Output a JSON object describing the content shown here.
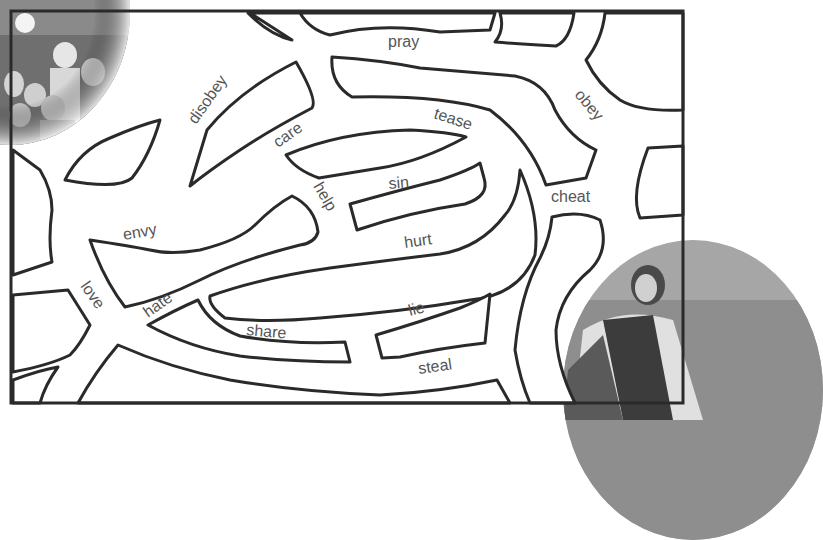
{
  "worksheet": {
    "type": "word maze",
    "start_image": "children by the sea",
    "end_image": "Jesus"
  },
  "words": [
    {
      "text": "pray",
      "x": 405,
      "y": 47,
      "rotate": 0
    },
    {
      "text": "disobey",
      "x": 208,
      "y": 100,
      "rotate": -55
    },
    {
      "text": "obey",
      "x": 584,
      "y": 110,
      "rotate": 52
    },
    {
      "text": "care",
      "x": 293,
      "y": 135,
      "rotate": -35
    },
    {
      "text": "tease",
      "x": 457,
      "y": 128,
      "rotate": 18
    },
    {
      "text": "sin",
      "x": 403,
      "y": 186,
      "rotate": -5
    },
    {
      "text": "help",
      "x": 322,
      "y": 200,
      "rotate": 60
    },
    {
      "text": "cheat",
      "x": 575,
      "y": 200,
      "rotate": 0
    },
    {
      "text": "envy",
      "x": 145,
      "y": 234,
      "rotate": -10
    },
    {
      "text": "hurt",
      "x": 424,
      "y": 243,
      "rotate": -8
    },
    {
      "text": "love",
      "x": 92,
      "y": 298,
      "rotate": 55
    },
    {
      "text": "hate",
      "x": 163,
      "y": 306,
      "rotate": -35
    },
    {
      "text": "lie",
      "x": 420,
      "y": 310,
      "rotate": -15
    },
    {
      "text": "share",
      "x": 272,
      "y": 333,
      "rotate": 5
    },
    {
      "text": "steal",
      "x": 438,
      "y": 368,
      "rotate": -8
    }
  ],
  "colors": {
    "line": "#2a2a2a",
    "text": "#555555",
    "background": "#ffffff"
  }
}
